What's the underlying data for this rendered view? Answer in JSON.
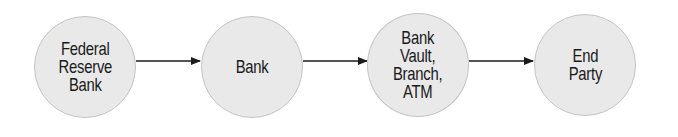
{
  "diagram": {
    "type": "flow",
    "direction": "left-to-right",
    "colors": {
      "node_fill": "#e9e9e9",
      "node_border": "#c4c4c4",
      "text": "#1a1a1a",
      "arrow": "#1a1a1a"
    },
    "nodes": [
      {
        "id": "federal-reserve-bank",
        "label": "Federal\nReserve\nBank"
      },
      {
        "id": "bank",
        "label": "Bank"
      },
      {
        "id": "bank-vault-branch-atm",
        "label": "Bank\nVault,\nBranch,\nATM"
      },
      {
        "id": "end-party",
        "label": "End\nParty"
      }
    ],
    "edges": [
      {
        "from": "federal-reserve-bank",
        "to": "bank"
      },
      {
        "from": "bank",
        "to": "bank-vault-branch-atm"
      },
      {
        "from": "bank-vault-branch-atm",
        "to": "end-party"
      }
    ]
  }
}
